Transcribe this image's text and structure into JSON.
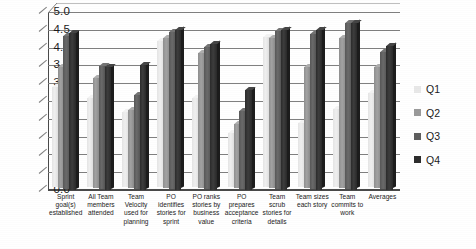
{
  "chart_data": {
    "type": "bar",
    "title": "",
    "subtitle": "",
    "xlabel": "",
    "ylabel": "",
    "ylim": [
      0.0,
      5.0
    ],
    "ytick_step": 0.5,
    "yticks": [
      "5.0",
      "4.5",
      "4.0",
      "3.5",
      "3.0",
      "2.5",
      "2.0",
      "1.5",
      "1.0",
      "0.5",
      "0.0"
    ],
    "grid": true,
    "legend_position": "right",
    "style": "3d-clustered-column",
    "categories": [
      "Sprint goal(s) established",
      "All Team members attended",
      "Team Velocity used for planning",
      "PO identifies stories for sprint",
      "PO ranks stories by business value",
      "PO prepares acceptance criteria",
      "Team scrub stories for details",
      "Team sizes each story",
      "Team commits to work",
      "Averages"
    ],
    "categories_lines": [
      [
        "Sprint",
        "goal(s)",
        "established"
      ],
      [
        "All Team",
        "members",
        "attended"
      ],
      [
        "Team",
        "Velocity",
        "used for",
        "planning"
      ],
      [
        "PO",
        "identifies",
        "stories for",
        "sprint"
      ],
      [
        "PO ranks",
        "stories by",
        "business",
        "value"
      ],
      [
        "PO prepares",
        "acceptance",
        "criteria"
      ],
      [
        "Team scrub",
        "stories for",
        "details"
      ],
      [
        "Team sizes",
        "each story"
      ],
      [
        "Team",
        "commits to",
        "work"
      ],
      [
        "Averages"
      ]
    ],
    "series": [
      {
        "name": "Q1",
        "color": "#e8e8e8",
        "values": [
          2.8,
          2.5,
          2.1,
          4.1,
          2.5,
          1.5,
          4.2,
          1.8,
          2.2,
          2.65
        ]
      },
      {
        "name": "Q2",
        "color": "#9a9a9a",
        "values": [
          3.4,
          3.1,
          2.2,
          4.2,
          3.8,
          1.8,
          4.2,
          3.4,
          4.2,
          3.4
        ]
      },
      {
        "name": "Q3",
        "color": "#5e5e5e",
        "values": [
          4.3,
          3.45,
          2.65,
          4.4,
          4.0,
          2.2,
          4.45,
          4.35,
          4.65,
          3.85
        ]
      },
      {
        "name": "Q4",
        "color": "#2d2d2d",
        "values": [
          4.4,
          3.45,
          3.5,
          4.5,
          4.1,
          2.8,
          4.5,
          4.5,
          4.7,
          4.05
        ]
      }
    ]
  },
  "legend": {
    "items": [
      {
        "label": "Q1"
      },
      {
        "label": "Q2"
      },
      {
        "label": "Q3"
      },
      {
        "label": "Q4"
      }
    ]
  }
}
